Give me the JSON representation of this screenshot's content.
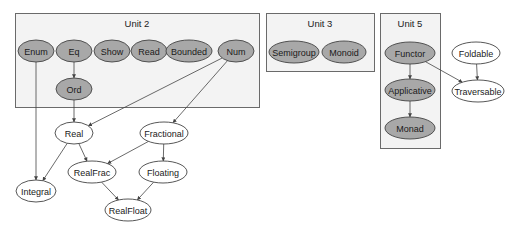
{
  "units": [
    {
      "id": "unit2",
      "label": "Unit 2",
      "x": 15,
      "y": 13,
      "w": 244,
      "h": 94
    },
    {
      "id": "unit3",
      "label": "Unit 3",
      "x": 266,
      "y": 13,
      "w": 108,
      "h": 58
    },
    {
      "id": "unit5",
      "label": "Unit 5",
      "x": 380,
      "y": 13,
      "w": 60,
      "h": 135
    }
  ],
  "nodes": [
    {
      "id": "enum",
      "label": "Enum",
      "cx": 36,
      "cy": 51,
      "rx": 18,
      "ry": 11,
      "filled": true
    },
    {
      "id": "eq",
      "label": "Eq",
      "cx": 74,
      "cy": 51,
      "rx": 18,
      "ry": 11,
      "filled": true
    },
    {
      "id": "show",
      "label": "Show",
      "cx": 112,
      "cy": 51,
      "rx": 18,
      "ry": 11,
      "filled": true
    },
    {
      "id": "read",
      "label": "Read",
      "cx": 149,
      "cy": 51,
      "rx": 18,
      "ry": 11,
      "filled": true
    },
    {
      "id": "bounded",
      "label": "Bounded",
      "cx": 189,
      "cy": 51,
      "rx": 23,
      "ry": 11,
      "filled": true
    },
    {
      "id": "num",
      "label": "Num",
      "cx": 236,
      "cy": 51,
      "rx": 18,
      "ry": 11,
      "filled": true
    },
    {
      "id": "ord",
      "label": "Ord",
      "cx": 74,
      "cy": 89,
      "rx": 18,
      "ry": 11,
      "filled": true
    },
    {
      "id": "semigroup",
      "label": "Semigroup",
      "cx": 294,
      "cy": 52,
      "rx": 25,
      "ry": 11,
      "filled": true
    },
    {
      "id": "monoid",
      "label": "Monoid",
      "cx": 344,
      "cy": 52,
      "rx": 22,
      "ry": 11,
      "filled": true
    },
    {
      "id": "functor",
      "label": "Functor",
      "cx": 410,
      "cy": 53,
      "rx": 25,
      "ry": 11,
      "filled": true
    },
    {
      "id": "applicative",
      "label": "Applicative",
      "cx": 410,
      "cy": 90,
      "rx": 25,
      "ry": 11,
      "filled": true
    },
    {
      "id": "monad",
      "label": "Monad",
      "cx": 410,
      "cy": 128,
      "rx": 25,
      "ry": 11,
      "filled": true
    },
    {
      "id": "foldable",
      "label": "Foldable",
      "cx": 476,
      "cy": 53,
      "rx": 24,
      "ry": 11,
      "filled": false
    },
    {
      "id": "traversable",
      "label": "Traversable",
      "cx": 478,
      "cy": 91,
      "rx": 26,
      "ry": 11,
      "filled": false
    },
    {
      "id": "real",
      "label": "Real",
      "cx": 74,
      "cy": 133,
      "rx": 19,
      "ry": 11,
      "filled": false
    },
    {
      "id": "fractional",
      "label": "Fractional",
      "cx": 164,
      "cy": 133,
      "rx": 24,
      "ry": 11,
      "filled": false
    },
    {
      "id": "realfrac",
      "label": "RealFrac",
      "cx": 92,
      "cy": 172,
      "rx": 24,
      "ry": 11,
      "filled": false
    },
    {
      "id": "floating",
      "label": "Floating",
      "cx": 163,
      "cy": 172,
      "rx": 24,
      "ry": 11,
      "filled": false
    },
    {
      "id": "integral",
      "label": "Integral",
      "cx": 36,
      "cy": 191,
      "rx": 20,
      "ry": 11,
      "filled": false
    },
    {
      "id": "realfloat",
      "label": "RealFloat",
      "cx": 128,
      "cy": 210,
      "rx": 23,
      "ry": 11,
      "filled": false
    }
  ],
  "edges": [
    {
      "from": "eq",
      "to": "ord"
    },
    {
      "from": "enum",
      "to": "integral"
    },
    {
      "from": "ord",
      "to": "real"
    },
    {
      "from": "num",
      "to": "real"
    },
    {
      "from": "num",
      "to": "fractional"
    },
    {
      "from": "real",
      "to": "integral"
    },
    {
      "from": "real",
      "to": "realfrac"
    },
    {
      "from": "fractional",
      "to": "realfrac"
    },
    {
      "from": "fractional",
      "to": "floating"
    },
    {
      "from": "realfrac",
      "to": "realfloat"
    },
    {
      "from": "floating",
      "to": "realfloat"
    },
    {
      "from": "functor",
      "to": "applicative"
    },
    {
      "from": "applicative",
      "to": "monad"
    },
    {
      "from": "functor",
      "to": "traversable"
    },
    {
      "from": "foldable",
      "to": "traversable"
    }
  ],
  "colors": {
    "filled_node": "#a8a8a8",
    "open_node": "#ffffff",
    "box_bg": "#f3f3f3",
    "stroke": "#444444"
  }
}
